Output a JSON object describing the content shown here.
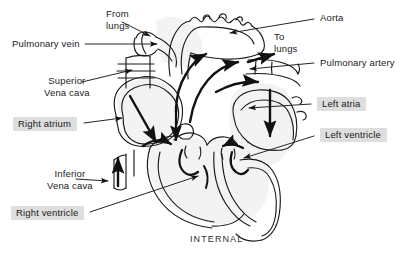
{
  "figure": {
    "caption": "INTERNAL",
    "highlight_color": "#dedede",
    "ink_color": "#1a1a1a",
    "background_color": "#ffffff"
  },
  "labels": {
    "from_lungs": "From\nlungs",
    "from_lungs_line1": "From",
    "from_lungs_line2": "lungs",
    "pulmonary_vein": "Pulmonary vein",
    "superior_vena_cava_line1": "Superior",
    "superior_vena_cava_line2": "Vena cava",
    "right_atrium": "Right atrium",
    "inferior_vena_cava_line1": "Inferior",
    "inferior_vena_cava_line2": "Vena cava",
    "right_ventricle": "Right  ventricle",
    "aorta": "Aorta",
    "to_lungs_line1": "To",
    "to_lungs_line2": "lungs",
    "pulmonary_artery": "Pulmonary artery",
    "left_atria": "Left atria",
    "left_ventricle": "Left ventricle"
  }
}
